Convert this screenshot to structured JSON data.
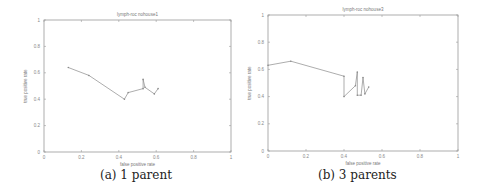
{
  "chart_data": [
    {
      "type": "line",
      "title": "lymph-roc nohouse1",
      "xlabel": "false positive rate",
      "ylabel": "true positive rate",
      "xlim": [
        0,
        1
      ],
      "ylim": [
        0,
        1
      ],
      "xticks": [
        "0",
        "0.2",
        "0.4",
        "0.6",
        "0.8",
        "1"
      ],
      "yticks": [
        "0",
        "0.2",
        "0.4",
        "0.6",
        "0.8",
        "1"
      ],
      "grid": false,
      "caption": "(a) 1 parent",
      "series": [
        {
          "name": "roc",
          "x": [
            0.13,
            0.24,
            0.43,
            0.45,
            0.53,
            0.53,
            0.54,
            0.59,
            0.61
          ],
          "y": [
            0.64,
            0.58,
            0.4,
            0.45,
            0.48,
            0.55,
            0.49,
            0.44,
            0.48
          ]
        }
      ]
    },
    {
      "type": "line",
      "title": "lymph-roc nohouse3",
      "xlabel": "false positive rate",
      "ylabel": "true positive rate",
      "xlim": [
        0,
        1
      ],
      "ylim": [
        0,
        1
      ],
      "xticks": [
        "0",
        "0.2",
        "0.4",
        "0.6",
        "0.8",
        "1"
      ],
      "yticks": [
        "0",
        "0.2",
        "0.4",
        "0.6",
        "0.8",
        "1"
      ],
      "grid": false,
      "caption": "(b) 3 parents",
      "series": [
        {
          "name": "roc",
          "x": [
            0.0,
            0.12,
            0.4,
            0.4,
            0.46,
            0.47,
            0.47,
            0.49,
            0.5,
            0.51,
            0.53
          ],
          "y": [
            0.63,
            0.66,
            0.55,
            0.4,
            0.48,
            0.58,
            0.41,
            0.41,
            0.54,
            0.42,
            0.47
          ]
        }
      ]
    }
  ],
  "captions": {
    "a": "(a) 1 parent",
    "b": "(b) 3 parents"
  }
}
